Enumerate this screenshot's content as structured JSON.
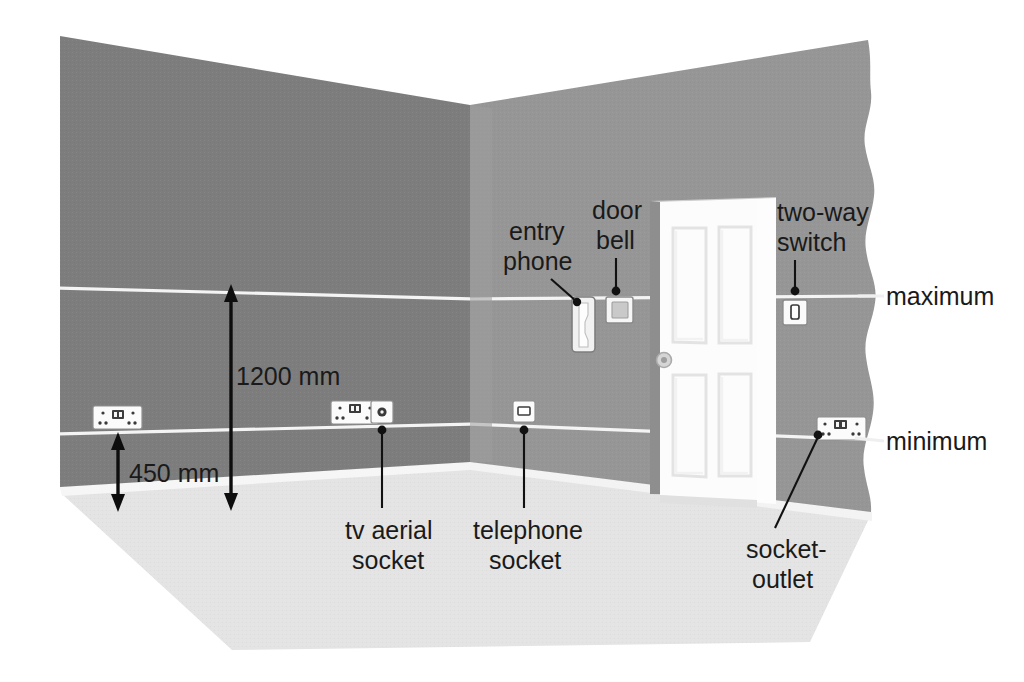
{
  "diagram": {
    "colors": {
      "left_wall": "#7d7d7d",
      "right_wall": "#969696",
      "floor": "#e2e2e2",
      "floor_edge": "#f7f7f7",
      "guide_line": "#f2f2f2",
      "background": "#ffffff",
      "text": "#1a1a1a",
      "accessory_face": "#fbfbfb",
      "accessory_outline": "#9a9a9a",
      "door": "#fdfdfd",
      "door_frame": "#d9d9d9",
      "leader": "#111111"
    },
    "dimensions": [
      {
        "name": "1200 mm",
        "value": "1200 mm",
        "unit": "mm",
        "magnitude": 1200
      },
      {
        "name": "450 mm",
        "value": "450 mm",
        "unit": "mm",
        "magnitude": 450
      }
    ],
    "edge_labels": [
      {
        "name": "maximum",
        "text": "maximum"
      },
      {
        "name": "minimum",
        "text": "minimum"
      }
    ],
    "callouts": [
      {
        "name": "entry-phone",
        "line1": "entry",
        "line2": "phone"
      },
      {
        "name": "door-bell",
        "line1": "door",
        "line2": "bell"
      },
      {
        "name": "two-way-switch",
        "line1": "two-way",
        "line2": "switch"
      },
      {
        "name": "tv-aerial-socket",
        "line1": "tv aerial",
        "line2": "socket"
      },
      {
        "name": "telephone-socket",
        "line1": "telephone",
        "line2": "socket"
      },
      {
        "name": "socket-outlet",
        "line1": "socket-",
        "line2": "outlet"
      }
    ],
    "accessories": [
      {
        "name": "socket-outlet-left-wall",
        "type": "twin-socket"
      },
      {
        "name": "socket-outlet-left-wall-right",
        "type": "twin-socket"
      },
      {
        "name": "tv-aerial-socket",
        "type": "coax-outlet"
      },
      {
        "name": "telephone-socket",
        "type": "telephone-outlet"
      },
      {
        "name": "entry-phone",
        "type": "entry-phone-handset"
      },
      {
        "name": "door-bell",
        "type": "bell-push"
      },
      {
        "name": "two-way-switch",
        "type": "single-rocker-switch"
      },
      {
        "name": "socket-outlet-right-wall",
        "type": "twin-socket"
      }
    ]
  },
  "labels": {
    "dim_1200": "1200 mm",
    "dim_450": "450 mm",
    "maximum": "maximum",
    "minimum": "minimum",
    "entry_1": "entry",
    "entry_2": "phone",
    "bell_1": "door",
    "bell_2": "bell",
    "switch_1": "two-way",
    "switch_2": "switch",
    "tv_1": "tv aerial",
    "tv_2": "socket",
    "tel_1": "telephone",
    "tel_2": "socket",
    "out_1": "socket-",
    "out_2": "outlet"
  }
}
